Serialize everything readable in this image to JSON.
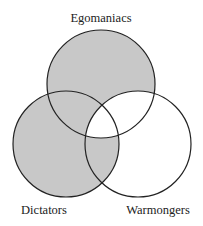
{
  "diagram": {
    "type": "venn",
    "sets": [
      {
        "id": "E",
        "label": "Egomaniacs"
      },
      {
        "id": "D",
        "label": "Dictators"
      },
      {
        "id": "W",
        "label": "Warmongers"
      }
    ],
    "shaded_regions": [
      "E only",
      "E∩D not W",
      "D only",
      "D∩W not E"
    ],
    "unshaded_regions": [
      "E∩W not D",
      "E∩D∩W",
      "W only"
    ],
    "colors": {
      "shade": "#c8c8c8",
      "stroke": "#222222",
      "background": "#ffffff"
    }
  }
}
